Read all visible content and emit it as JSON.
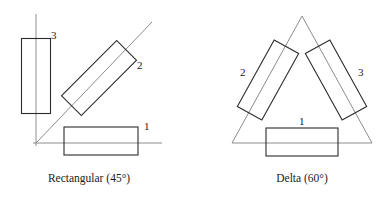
{
  "figure": {
    "name": "winding-configurations-diagram",
    "panels": [
      {
        "id": "rectangular",
        "caption": "Rectangular (45°)",
        "caption_x": 89,
        "caption_y": 182,
        "axes": [
          {
            "name": "vertical-axis",
            "x1": 36,
            "y1": 14,
            "x2": 36,
            "y2": 146
          },
          {
            "name": "horizontal-axis",
            "x1": 33,
            "y1": 143,
            "x2": 162,
            "y2": 143
          },
          {
            "name": "diagonal-axis-45",
            "x1": 36,
            "y1": 143,
            "x2": 152,
            "y2": 22
          }
        ],
        "coils": [
          {
            "label": "1",
            "cx": 101,
            "cy": 141,
            "w": 74,
            "h": 28,
            "angle": 0,
            "label_x": 144,
            "label_y": 130
          },
          {
            "label": "2",
            "cx": 99,
            "cy": 78,
            "w": 78,
            "h": 28,
            "angle": -45,
            "label_x": 137,
            "label_y": 69
          },
          {
            "label": "3",
            "cx": 36,
            "cy": 76,
            "w": 29,
            "h": 75,
            "angle": 0,
            "label_x": 51,
            "label_y": 39
          }
        ]
      },
      {
        "id": "delta",
        "caption": "Delta (60°)",
        "caption_x": 302,
        "caption_y": 182,
        "axes": [
          {
            "name": "triangle-side-left",
            "x1": 302,
            "y1": 16,
            "x2": 232,
            "y2": 143
          },
          {
            "name": "triangle-side-right",
            "x1": 302,
            "y1": 16,
            "x2": 372,
            "y2": 143
          },
          {
            "name": "triangle-base",
            "x1": 232,
            "y1": 143,
            "x2": 372,
            "y2": 143
          }
        ],
        "coils": [
          {
            "label": "1",
            "cx": 302,
            "cy": 142,
            "w": 72,
            "h": 28,
            "angle": 0,
            "label_x": 299,
            "label_y": 125
          },
          {
            "label": "2",
            "cx": 268,
            "cy": 80,
            "w": 28,
            "h": 76,
            "angle": 29,
            "label_x": 240,
            "label_y": 76
          },
          {
            "label": "3",
            "cx": 336,
            "cy": 80,
            "w": 28,
            "h": 76,
            "angle": -29,
            "label_x": 358,
            "label_y": 76
          }
        ]
      }
    ]
  },
  "colors": {
    "axis": "#8c8c8c",
    "coil_stroke": "#2b2b2b",
    "text": "#1a1a1a",
    "background": "#ffffff"
  }
}
